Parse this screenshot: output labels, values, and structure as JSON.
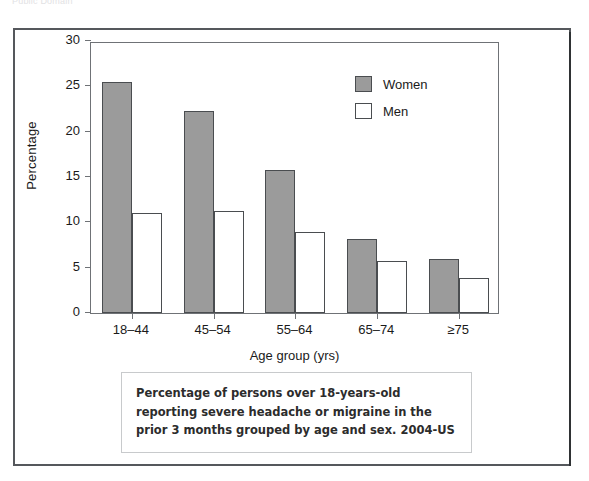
{
  "top_note": "Public Domain",
  "chart_data": {
    "type": "bar",
    "title": "",
    "xlabel": "Age group (yrs)",
    "ylabel": "Percentage",
    "ylim": [
      0,
      30
    ],
    "yticks": [
      0,
      5,
      10,
      15,
      20,
      25,
      30
    ],
    "ytick_labels": [
      "0",
      "5",
      "10",
      "15",
      "20",
      "25",
      "30"
    ],
    "grid": false,
    "legend_position": "upper right",
    "categories": [
      "18–44",
      "45–54",
      "55–64",
      "65–74",
      "≥75"
    ],
    "series": [
      {
        "name": "Women",
        "color": "#9b9b9b",
        "values": [
          25.5,
          22.3,
          15.8,
          8.2,
          6.0
        ]
      },
      {
        "name": "Men",
        "color": "#ffffff",
        "values": [
          11.0,
          11.3,
          8.9,
          5.7,
          3.9
        ]
      }
    ]
  },
  "legend": {
    "items": [
      {
        "label": "Women",
        "swatch": "women"
      },
      {
        "label": "Men",
        "swatch": "men"
      }
    ]
  },
  "caption": {
    "text": "Percentage of persons over 18-years-old reporting severe headache or migraine in the prior 3 months grouped by age and sex. 2004-US"
  }
}
